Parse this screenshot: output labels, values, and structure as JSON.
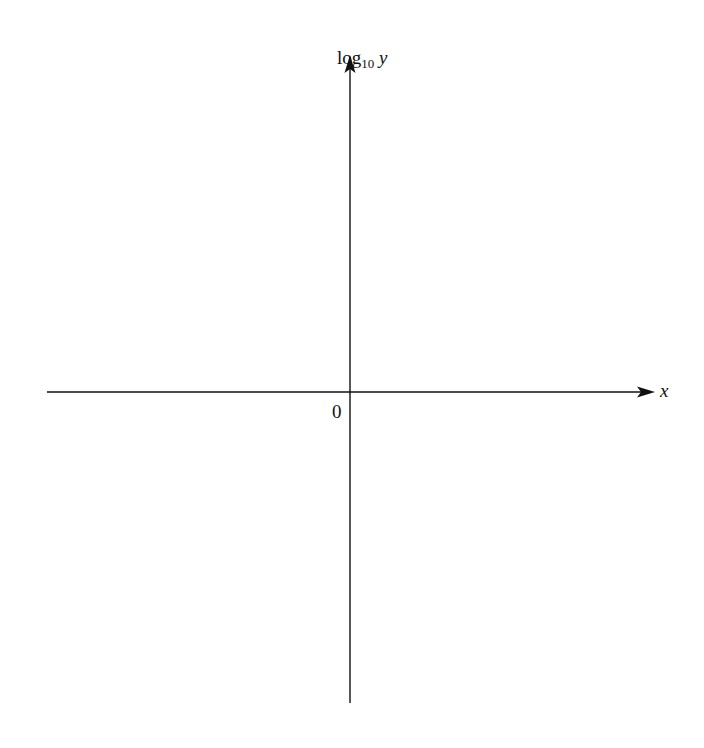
{
  "diagram": {
    "type": "coordinate-axes",
    "y_axis": {
      "label_prefix": "log",
      "label_subscript": "10",
      "label_var": "y",
      "x": 350,
      "y_top": 55,
      "y_bottom": 703
    },
    "x_axis": {
      "label": "x",
      "y": 392,
      "x_left": 47,
      "x_right": 655
    },
    "origin_label": "0",
    "colors": {
      "axis": "#111111",
      "background": "#ffffff"
    }
  }
}
